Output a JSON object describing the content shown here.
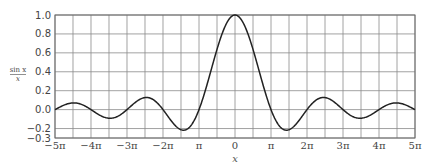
{
  "chart_data": {
    "type": "line",
    "title": "",
    "xlabel": "x",
    "ylabel": "sin x / x",
    "ylabel_numerator": "sin x",
    "ylabel_denominator": "x",
    "function": "sin(x)/x",
    "xlim": [
      -15.70796,
      15.70796
    ],
    "ylim": [
      -0.3,
      1.0
    ],
    "grid": true,
    "x_grid_step": "pi/2",
    "y_ticks": [
      1.0,
      0.8,
      0.6,
      0.4,
      0.2,
      0.0,
      -0.2,
      -0.3
    ],
    "y_tick_labels": [
      "1.0",
      "0.8",
      "0.6",
      "0.4",
      "0.2",
      "0.0",
      "−0.2",
      "−0.3"
    ],
    "x_ticks_multiples_of_pi": [
      -5,
      -4,
      -3,
      -2,
      -1,
      0,
      1,
      2,
      3,
      4,
      5
    ],
    "x_tick_labels": [
      "−5π",
      "−4π",
      "−3π",
      "−2π",
      "π",
      "0",
      "π",
      "2π",
      "3π",
      "4π",
      "5π"
    ],
    "series": [
      {
        "name": "sin x / x",
        "x": [
          "-5π",
          "-4.5π",
          "-4π",
          "-3.5π",
          "-3π",
          "-2.5π",
          "-2π",
          "-1.5π",
          "-π",
          "-0.5π",
          "0",
          "0.5π",
          "π",
          "1.5π",
          "2π",
          "2.5π",
          "3π",
          "3.5π",
          "4π",
          "4.5π",
          "5π"
        ],
        "values": [
          0.0,
          0.071,
          0.0,
          -0.091,
          0.0,
          0.127,
          0.0,
          -0.212,
          0.0,
          0.637,
          1.0,
          0.637,
          0.0,
          -0.212,
          0.0,
          0.127,
          0.0,
          -0.091,
          0.0,
          0.071,
          0.0
        ]
      }
    ]
  },
  "plot_area": {
    "left": 55,
    "top": 15,
    "right": 415,
    "bottom": 138
  }
}
